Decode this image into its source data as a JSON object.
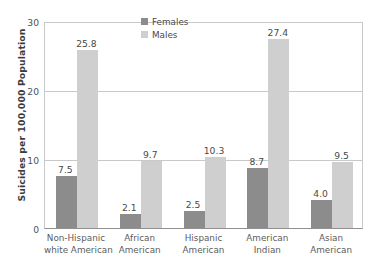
{
  "chart_data": {
    "type": "bar",
    "title": "",
    "subtitle": "",
    "xlabel": "",
    "ylabel": "Suicides per 100,000 Population",
    "ylim": [
      0,
      30
    ],
    "yticks": [
      "0",
      "10",
      "20",
      "30"
    ],
    "grid": true,
    "legend_position": "top-center",
    "categories": [
      "Non-Hispanic white American",
      "African American",
      "Hispanic American",
      "American Indian",
      "Asian American"
    ],
    "category_lines": [
      [
        "Non-Hispanic",
        "white American"
      ],
      [
        "African",
        "American"
      ],
      [
        "Hispanic",
        "American"
      ],
      [
        "American",
        "Indian"
      ],
      [
        "Asian",
        "American"
      ]
    ],
    "series": [
      {
        "name": "Females",
        "color": "#8c8c8c",
        "values": [
          7.5,
          2.1,
          2.5,
          8.7,
          4.0
        ],
        "labels": [
          "7.5",
          "2.1",
          "2.5",
          "8.7",
          "4.0"
        ]
      },
      {
        "name": "Males",
        "color": "#cfcfcf",
        "values": [
          25.8,
          9.7,
          10.3,
          27.4,
          9.5
        ],
        "labels": [
          "25.8",
          "9.7",
          "10.3",
          "27.4",
          "9.5"
        ]
      }
    ]
  },
  "legend": {
    "items": [
      {
        "label": "Females",
        "swatch": "female-swatch"
      },
      {
        "label": "Males",
        "swatch": "male-swatch"
      }
    ]
  },
  "axis": {
    "y_title": "Suicides per 100,000 Population",
    "y_ticks": [
      "30",
      "20",
      "10",
      "0"
    ]
  },
  "colors": {
    "female_bar": "#8c8c8c",
    "male_bar": "#cfcfcf",
    "gridline": "#c9c9c9",
    "axis": "#8f8f8f",
    "text": "#4a4a4a",
    "background": "#ffffff"
  }
}
